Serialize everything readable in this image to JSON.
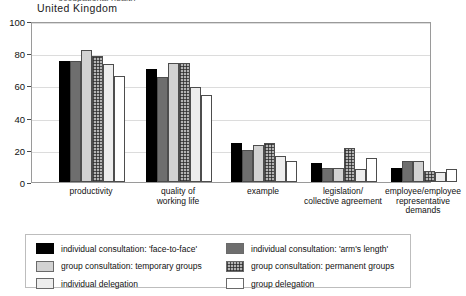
{
  "clipped_title": "occupational health",
  "subtitle": "United  Kingdom",
  "chart_data": {
    "type": "bar",
    "title": "United  Kingdom",
    "xlabel": "",
    "ylabel": "",
    "ylim": [
      0,
      100
    ],
    "yticks": [
      0,
      20,
      40,
      60,
      80,
      100
    ],
    "grid": true,
    "legend_position": "bottom",
    "categories": [
      "productivity",
      "quality of\nworking life",
      "example",
      "legislation/\ncollective agreement",
      "employee/employee\nrepresentative\ndemands"
    ],
    "series": [
      {
        "name": "individual consultation: 'face-to-face'",
        "color": "#000000",
        "values": [
          75,
          70,
          24,
          12,
          9
        ]
      },
      {
        "name": "individual consultation: 'arm's length'",
        "color": "#6e6e6e",
        "values": [
          75,
          65,
          20,
          9,
          13
        ]
      },
      {
        "name": "group consultation: temporary groups",
        "color": "#d2d2d2",
        "values": [
          82,
          74,
          23,
          9,
          13
        ]
      },
      {
        "name": "group consultation: permanent groups",
        "color": "#b4b4b4",
        "values": [
          78,
          74,
          24,
          21,
          7
        ]
      },
      {
        "name": "individual delegation",
        "color": "#ededed",
        "values": [
          73,
          59,
          16,
          8,
          6
        ]
      },
      {
        "name": "group delegation",
        "color": "#ffffff",
        "values": [
          66,
          54,
          13,
          15,
          8
        ]
      }
    ]
  },
  "legend": {
    "left": [
      "individual consultation: 'face-to-face'",
      "group consultation: temporary groups",
      "individual delegation"
    ],
    "right": [
      "individual consultation: 'arm's length'",
      "group consultation: permanent groups",
      "group delegation"
    ]
  }
}
